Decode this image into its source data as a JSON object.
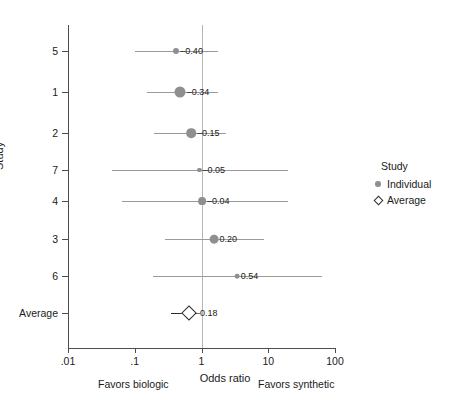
{
  "chart_data": {
    "type": "scatter",
    "subtype": "forest-plot",
    "title": "",
    "xlabel": "Odds ratio",
    "ylabel": "Study",
    "xscale": "log",
    "xlim": [
      0.01,
      100
    ],
    "xticks": [
      0.01,
      0.1,
      1,
      10,
      100
    ],
    "xticklabels": [
      ".01",
      ".1",
      "1",
      "10",
      "100"
    ],
    "grid": false,
    "reference_line": 1,
    "annotations": {
      "left": "Favors biologic",
      "right": "Favors synthetic"
    },
    "categories": [
      "5",
      "1",
      "2",
      "7",
      "4",
      "3",
      "6",
      "Average"
    ],
    "points": [
      {
        "study": "5",
        "label": "–0.40",
        "or": 0.42,
        "ci_low": 0.1,
        "ci_high": 1.75,
        "weight": 0.38,
        "kind": "individual"
      },
      {
        "study": "1",
        "label": "–0.34",
        "or": 0.48,
        "ci_low": 0.155,
        "ci_high": 1.75,
        "weight": 1.0,
        "kind": "individual"
      },
      {
        "study": "2",
        "label": "–0.15",
        "or": 0.7,
        "ci_low": 0.195,
        "ci_high": 2.35,
        "weight": 0.82,
        "kind": "individual"
      },
      {
        "study": "7",
        "label": "–0.05",
        "or": 0.93,
        "ci_low": 0.045,
        "ci_high": 19.5,
        "weight": 0.14,
        "kind": "individual"
      },
      {
        "study": "4",
        "label": "–0.04",
        "or": 1.02,
        "ci_low": 0.064,
        "ci_high": 20.0,
        "weight": 0.6,
        "kind": "individual"
      },
      {
        "study": "3",
        "label": "0.20",
        "or": 1.55,
        "ci_low": 0.285,
        "ci_high": 8.7,
        "weight": 0.72,
        "kind": "individual"
      },
      {
        "study": "6",
        "label": "0.54",
        "or": 3.45,
        "ci_low": 0.185,
        "ci_high": 63.0,
        "weight": 0.22,
        "kind": "individual"
      },
      {
        "study": "Average",
        "label": "–0.18",
        "or": 0.66,
        "ci_low": 0.355,
        "ci_high": 0.8,
        "weight": 0.55,
        "kind": "average"
      }
    ],
    "legend": {
      "position": "right",
      "title": "Study",
      "entries": [
        {
          "label": "Individual",
          "marker": "filled-circle",
          "color": "#8f8f8f"
        },
        {
          "label": "Average",
          "marker": "open-diamond",
          "color": "#2b2b2b"
        }
      ]
    },
    "colors": {
      "individual_marker": "#8f8f8f",
      "average_marker": "#2b2b2b",
      "ci_line": "#9a9a9a",
      "average_ci_line": "#2b2b2b",
      "axis": "#4d4d4d",
      "reference_line": "#b6b6b6",
      "background": "#ffffff",
      "text": "#1a1a1a"
    }
  }
}
